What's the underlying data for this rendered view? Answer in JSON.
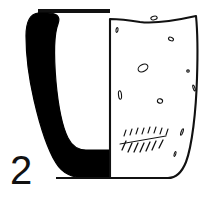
{
  "figure": {
    "type": "archaeological-vessel-profile-drawing",
    "catalog_number": "2",
    "title": "",
    "caption": "",
    "background_color": "#ffffff",
    "ink_color": "#111111",
    "section_fill_color": "#000000",
    "body_fill_color": "#ffffff",
    "view": {
      "left_half": "section (cut) profile, solid black fill",
      "right_half": "exterior surface view, outline with inclusion marks"
    },
    "elements": {
      "rim_line_label": "rim datum line",
      "section_label": "vessel wall section",
      "exterior_label": "exterior surface",
      "base_label": "flat base",
      "number_label": "2"
    },
    "inclusions": [
      {
        "cx": 154,
        "cy": 18,
        "rx": 3.2,
        "ry": 1.8,
        "rot": -12
      },
      {
        "cx": 117,
        "cy": 30,
        "rx": 1.0,
        "ry": 2.4,
        "rot": 8
      },
      {
        "cx": 171,
        "cy": 39,
        "rx": 2.6,
        "ry": 1.7,
        "rot": 24
      },
      {
        "cx": 143,
        "cy": 68,
        "rx": 5.2,
        "ry": 3.4,
        "rot": -28
      },
      {
        "cx": 188,
        "cy": 71,
        "rx": 1.3,
        "ry": 1.1,
        "rot": 0
      },
      {
        "cx": 120,
        "cy": 95,
        "rx": 1.5,
        "ry": 4.2,
        "rot": -6
      },
      {
        "cx": 160,
        "cy": 101,
        "rx": 2.6,
        "ry": 2.2,
        "rot": 14
      },
      {
        "cx": 194,
        "cy": 88,
        "rx": 0.9,
        "ry": 3.0,
        "rot": -18
      },
      {
        "cx": 182,
        "cy": 132,
        "rx": 0.9,
        "ry": 3.4,
        "rot": 20
      },
      {
        "cx": 175,
        "cy": 154,
        "rx": 0.8,
        "ry": 2.6,
        "rot": 16
      }
    ],
    "hatch_marks_upper": [
      {
        "x1": 124,
        "y1": 136,
        "x2": 126,
        "y2": 130
      },
      {
        "x1": 130,
        "y1": 135,
        "x2": 132,
        "y2": 129
      },
      {
        "x1": 136,
        "y1": 134,
        "x2": 138,
        "y2": 128
      },
      {
        "x1": 142,
        "y1": 134,
        "x2": 144,
        "y2": 128
      },
      {
        "x1": 148,
        "y1": 133,
        "x2": 150,
        "y2": 127
      },
      {
        "x1": 154,
        "y1": 133,
        "x2": 156,
        "y2": 127
      },
      {
        "x1": 160,
        "y1": 134,
        "x2": 162,
        "y2": 128
      },
      {
        "x1": 166,
        "y1": 135,
        "x2": 168,
        "y2": 129
      }
    ],
    "hatch_marks_lower": [
      {
        "x1": 122,
        "y1": 150,
        "x2": 126,
        "y2": 141
      },
      {
        "x1": 128,
        "y1": 152,
        "x2": 132,
        "y2": 143
      },
      {
        "x1": 134,
        "y1": 152,
        "x2": 138,
        "y2": 143
      },
      {
        "x1": 140,
        "y1": 152,
        "x2": 144,
        "y2": 143
      },
      {
        "x1": 146,
        "y1": 151,
        "x2": 150,
        "y2": 142
      },
      {
        "x1": 152,
        "y1": 150,
        "x2": 156,
        "y2": 141
      },
      {
        "x1": 159,
        "y1": 148,
        "x2": 163,
        "y2": 140
      }
    ],
    "hatch_band_line": {
      "x1": 120,
      "y1": 144,
      "x2": 166,
      "y2": 136
    },
    "geometry": {
      "rim_datum": {
        "x1": 38,
        "y1": 11,
        "x2": 110,
        "y2": 11,
        "thickness": 4
      },
      "section_outline_path": "M 38 13 C 30 14, 26 22, 26 36 C 26 52, 28 74, 34 100 C 40 126, 48 150, 56 163 C 62 173, 72 178, 86 178 L 110 178 L 110 150 L 86 150 C 78 150, 72 146, 68 138 C 62 126, 58 104, 56 82 C 54 58, 54 34, 58 24 C 61 16, 56 13, 48 13 Z",
      "body_outline_path": "M 110 19 L 110 178 L 168 178 C 176 178, 182 172, 186 162 C 192 146, 196 112, 197 78 C 198 48, 197 26, 196 16 C 178 20, 156 24, 140 22 C 128 20, 118 19, 110 19 Z",
      "divider_line": {
        "x1": 110,
        "y1": 19,
        "x2": 110,
        "y2": 178
      },
      "base_line": {
        "x1": 56,
        "y1": 178,
        "x2": 170,
        "y2": 178
      },
      "number_position": {
        "x": 10,
        "y": 184
      }
    }
  }
}
